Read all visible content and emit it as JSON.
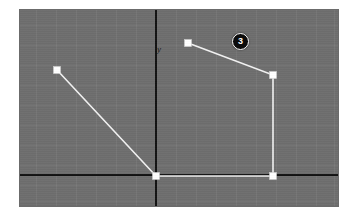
{
  "app": {
    "view_name": "graphics-editor-viewport",
    "background_color": "#6e6e6e",
    "grid_color": "#7a7a7a",
    "axis_color": "#121212",
    "path_color": "#f2f2f2",
    "vertex_color": "#ffffff",
    "badge_color": "#0b0b0b",
    "page_background": "#ffffff"
  },
  "axes": {
    "y_label": "y",
    "x_axis_name": "horizontal-axis",
    "y_axis_name": "vertical-axis",
    "origin": {
      "x": 136,
      "y": 165
    }
  },
  "badge": {
    "label": "3",
    "x": 212,
    "y": 23
  },
  "viewport": {
    "left": 20,
    "top": 10,
    "width": 318,
    "height": 196,
    "grid_spacing": 20
  },
  "chart_data": {
    "type": "line",
    "title": "",
    "xlabel": "",
    "ylabel": "y",
    "grid": true,
    "legend": "none",
    "xlim": [
      0,
      318
    ],
    "ylim": [
      0,
      196
    ],
    "series": [
      {
        "name": "polyline-path",
        "stroke": "#f2f2f2",
        "points": [
          {
            "x": 37,
            "y": 60,
            "label": "vertex-1"
          },
          {
            "x": 136,
            "y": 166,
            "label": "vertex-2"
          },
          {
            "x": 253,
            "y": 166,
            "label": "vertex-3"
          },
          {
            "x": 253,
            "y": 65,
            "label": "vertex-4"
          },
          {
            "x": 168,
            "y": 33,
            "label": "vertex-5"
          }
        ]
      }
    ]
  }
}
